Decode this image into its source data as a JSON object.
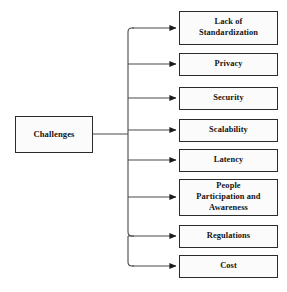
{
  "diagram": {
    "title": "Challenges",
    "type": "tree-fan-out",
    "root": {
      "id": "challenges",
      "label": "Challenges"
    },
    "branches": [
      {
        "id": "lack-of-standardization",
        "label": "Lack of\nStandardization"
      },
      {
        "id": "privacy",
        "label": "Privacy"
      },
      {
        "id": "security",
        "label": "Security"
      },
      {
        "id": "scalability",
        "label": "Scalability"
      },
      {
        "id": "latency",
        "label": "Latency"
      },
      {
        "id": "people-participation-and-awareness",
        "label": "People\nParticipation and\nAwareness"
      },
      {
        "id": "regulations",
        "label": "Regulations"
      },
      {
        "id": "cost",
        "label": "Cost"
      }
    ],
    "colors": {
      "background": "#ffffff",
      "box_fill": "#fbfbfb",
      "box_border": "#2b2b2b",
      "text": "#141414",
      "connector": "#4a4a4a",
      "arrowhead": "#1c1c1c"
    }
  }
}
